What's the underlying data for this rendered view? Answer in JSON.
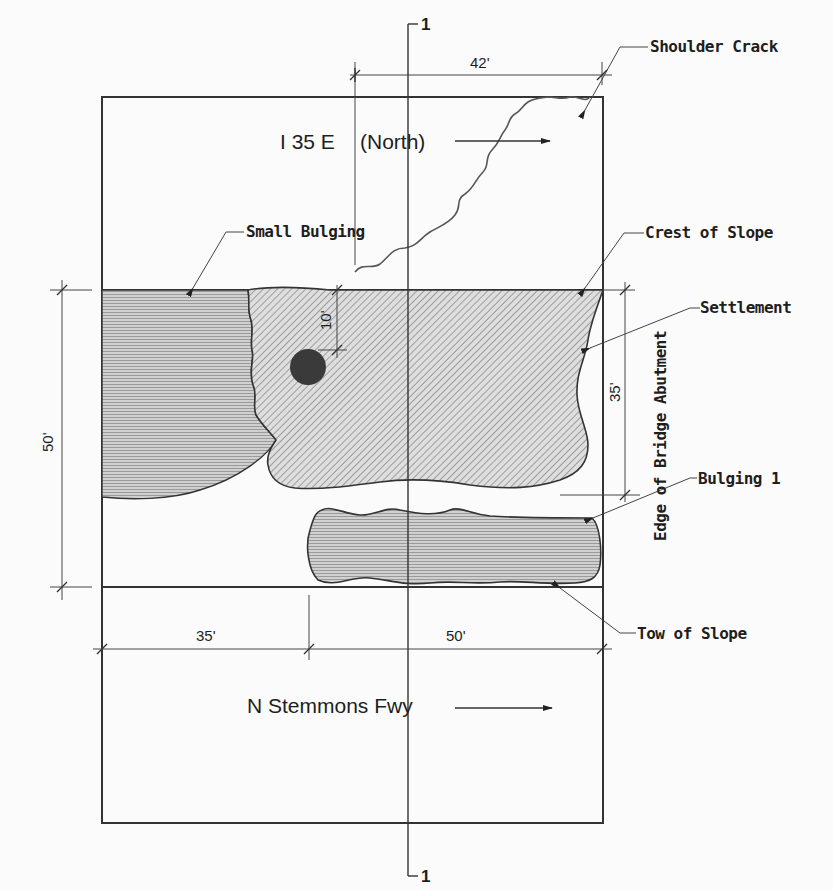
{
  "diagram": {
    "type": "site plan / slope failure sketch",
    "roads": {
      "top": "I 35 E",
      "top_direction": "(North)",
      "bottom": "N Stemmons Fwy"
    },
    "section_marker": {
      "top": "1",
      "bottom": "1"
    },
    "labels": {
      "shoulder_crack": "Shoulder Crack",
      "small_bulging": "Small Bulging",
      "crest_of_slope": "Crest of Slope",
      "settlement": "Settlement",
      "edge_of_bridge_abutment": "Edge of Bridge Abutment",
      "bulging_1": "Bulging 1",
      "tow_of_slope": "Tow of Slope"
    },
    "dimensions": {
      "top_width": "42'",
      "hole_offset": "10'",
      "right_height": "35'",
      "left_height": "50'",
      "bottom_left": "35'",
      "bottom_right": "50'"
    },
    "colors": {
      "line": "#333333",
      "hatch_fill": "#d2d2d2",
      "horizontal_fill": "#c4c4c4",
      "hole": "#3a3a3a",
      "background": "#fbfbfb"
    }
  }
}
